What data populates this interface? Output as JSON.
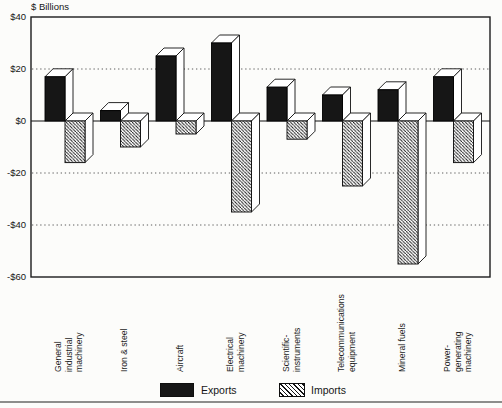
{
  "chart_data": {
    "type": "bar",
    "style": "3d-extruded-columns",
    "title": "",
    "ylabel": "$ Billions",
    "xlabel": "",
    "ylim": [
      -60,
      40
    ],
    "grid": "dotted horizontal lines at 20, -20, -40; solid zero line; solid frame at 40 and -60",
    "legend_position": "bottom-center",
    "categories": [
      "General industrial machinery",
      "Iron & steel",
      "Aircraft",
      "Electrical machinery",
      "Scientific instruments",
      "Telecommunications equipment",
      "Mineral fuels",
      "Power-generating machinery"
    ],
    "category_label_lines": [
      [
        "General",
        "industrial",
        "machinery"
      ],
      [
        "Iron & steel"
      ],
      [
        "Aircraft"
      ],
      [
        "Electrical",
        "machinery"
      ],
      [
        "Scientific-",
        "instruments"
      ],
      [
        "Telecommunications",
        "equipment"
      ],
      [
        "Mineral fuels"
      ],
      [
        "Power-",
        "generating",
        "machinery"
      ]
    ],
    "series": [
      {
        "name": "Exports",
        "swatch": "solid-black",
        "values": [
          17,
          4,
          25,
          30,
          13,
          10,
          12,
          17
        ]
      },
      {
        "name": "Imports",
        "swatch": "diagonal-hatch",
        "values": [
          -16,
          -10,
          -5,
          -35,
          -7,
          -25,
          -55,
          -16
        ]
      }
    ],
    "yticks": [
      {
        "value": 40,
        "label": "$40",
        "style": "border"
      },
      {
        "value": 20,
        "label": "$20",
        "style": "dotted"
      },
      {
        "value": 0,
        "label": "$0",
        "style": "solid"
      },
      {
        "value": -20,
        "label": "-$20",
        "style": "dotted"
      },
      {
        "value": -40,
        "label": "-$40",
        "style": "dotted"
      },
      {
        "value": -60,
        "label": "-$60",
        "style": "border"
      }
    ],
    "colors": {
      "exports_fill": "#161616",
      "imports_hatch_line": "#141414",
      "face_fill": "#ffffff",
      "outline": "#111111",
      "background": "#fcfcfa"
    }
  }
}
